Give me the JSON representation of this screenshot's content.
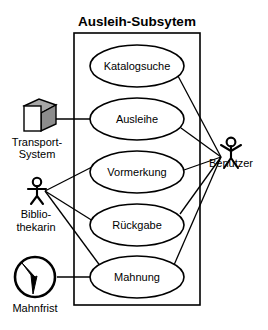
{
  "diagram": {
    "kind": "uml-use-case-diagram",
    "system": {
      "title": "Ausleih-Subsytem",
      "box": {
        "x": 74,
        "y": 33,
        "width": 126,
        "height": 272
      }
    },
    "use_cases": [
      {
        "id": "katalogsuche",
        "label": "Katalogsuche",
        "cx": 137,
        "cy": 66,
        "rx": 47,
        "ry": 21
      },
      {
        "id": "ausleihe",
        "label": "Ausleihe",
        "cx": 137,
        "cy": 119,
        "rx": 47,
        "ry": 21
      },
      {
        "id": "vormerkung",
        "label": "Vormerkung",
        "cx": 137,
        "cy": 172,
        "rx": 47,
        "ry": 21
      },
      {
        "id": "rueckgabe",
        "label": "Rückgabe",
        "cx": 137,
        "cy": 225,
        "rx": 47,
        "ry": 21
      },
      {
        "id": "mahnung",
        "label": "Mahnung",
        "cx": 137,
        "cy": 277,
        "rx": 47,
        "ry": 21
      }
    ],
    "actors": [
      {
        "id": "transport-system",
        "label_lines": [
          "Transport-",
          "System"
        ],
        "icon": "cube-icon",
        "type": "system-actor",
        "x": 37,
        "y": 120
      },
      {
        "id": "bibliothekarin",
        "label_lines": [
          "Biblio-",
          "thekarin"
        ],
        "icon": "stick-figure-icon",
        "type": "human-actor",
        "x": 37,
        "y": 192
      },
      {
        "id": "mahnfrist",
        "label_lines": [
          "Mahnfrist"
        ],
        "icon": "clock-icon",
        "type": "time-actor",
        "x": 35,
        "y": 277
      },
      {
        "id": "benutzer",
        "label_lines": [
          "Benutzer"
        ],
        "icon": "stick-figure-icon",
        "type": "human-actor",
        "x": 231,
        "y": 152
      }
    ],
    "associations": [
      {
        "from": "transport-system",
        "to": "ausleihe"
      },
      {
        "from": "bibliothekarin",
        "to": "vormerkung"
      },
      {
        "from": "bibliothekarin",
        "to": "rueckgabe"
      },
      {
        "from": "bibliothekarin",
        "to": "mahnung"
      },
      {
        "from": "mahnfrist",
        "to": "mahnung"
      },
      {
        "from": "benutzer",
        "to": "katalogsuche"
      },
      {
        "from": "benutzer",
        "to": "ausleihe"
      },
      {
        "from": "benutzer",
        "to": "vormerkung"
      },
      {
        "from": "benutzer",
        "to": "rueckgabe"
      },
      {
        "from": "benutzer",
        "to": "mahnung"
      }
    ],
    "colors": {
      "stroke": "#000000",
      "fill": "#ffffff",
      "cube_top": "#a8a8a8",
      "cube_side": "#8c8c8c"
    }
  }
}
